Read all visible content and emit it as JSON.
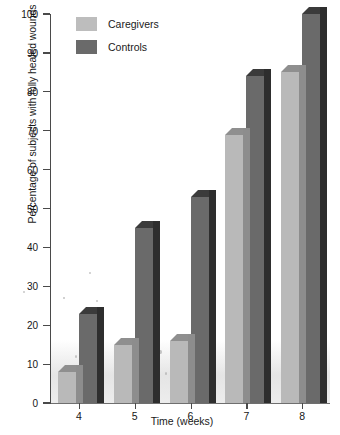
{
  "chart_data": {
    "type": "bar",
    "title": "",
    "xlabel": "Time (weeks)",
    "ylabel": "Percentage of subjects with fully healed wounds",
    "categories": [
      "4",
      "5",
      "6",
      "7",
      "8"
    ],
    "series": [
      {
        "name": "Caregivers",
        "values": [
          8,
          15,
          16,
          69,
          85
        ],
        "color": "#bdbdbd"
      },
      {
        "name": "Controls",
        "values": [
          23,
          45,
          53,
          84,
          100
        ],
        "color": "#6a6a6a"
      }
    ],
    "ylim": [
      0,
      100
    ],
    "yticks": [
      0,
      10,
      20,
      30,
      40,
      50,
      60,
      70,
      80,
      90,
      100
    ],
    "ytick_labels": [
      "0",
      "10",
      "20",
      "30",
      "40",
      "50",
      "60",
      "70",
      "80",
      "90",
      "100"
    ],
    "grid": false,
    "legend_position": "top-left",
    "style": "3d-grouped-bars"
  },
  "legend": {
    "items": [
      {
        "label": "Caregivers",
        "color": "#bdbdbd"
      },
      {
        "label": "Controls",
        "color": "#6a6a6a"
      }
    ]
  },
  "axes": {
    "x_label": "Time (weeks)",
    "y_label": "Percentage of subjects with fully healed wounds"
  }
}
